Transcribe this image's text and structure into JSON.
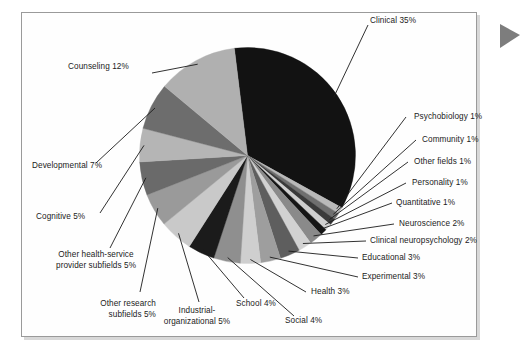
{
  "figure": {
    "type": "pie",
    "frame_border_color": "#9a9a9a",
    "background_color": "#ffffff",
    "marker_icon": "right-triangle-marker",
    "marker_color": "#7d7d7d"
  },
  "chart_data": {
    "type": "pie",
    "title": "",
    "xlabel": "",
    "ylabel": "",
    "units": "percent",
    "total": 100,
    "legend": "labels-with-leader-lines",
    "grid": false,
    "categories": [
      "Clinical",
      "Psychobiology",
      "Community",
      "Other fields",
      "Personality",
      "Quantitative",
      "Neuroscience",
      "Clinical neuropsychology",
      "Educational",
      "Experimental",
      "Health",
      "Social",
      "School",
      "Industrial-organizational",
      "Other research subfields",
      "Other health-service provider subfields",
      "Cognitive",
      "Developmental",
      "Counseling"
    ],
    "values": [
      35,
      1,
      1,
      1,
      1,
      1,
      2,
      2,
      3,
      3,
      3,
      4,
      4,
      5,
      5,
      5,
      5,
      7,
      12
    ],
    "colors": [
      "#121212",
      "#b9b9b9",
      "#6f6f6f",
      "#3a3a3a",
      "#cfcfcf",
      "#151515",
      "#8a8a8a",
      "#d2d2d2",
      "#5e5e5e",
      "#9e9e9e",
      "#cfcfcf",
      "#8f8f8f",
      "#1b1b1b",
      "#c9c9c9",
      "#9a9a9a",
      "#6a6a6a",
      "#b5b5b5",
      "#6d6d6d",
      "#b0b0b0"
    ],
    "slices": [
      {
        "label": "Clinical 35%",
        "name": "Clinical",
        "value": 35,
        "color": "#121212"
      },
      {
        "label": "Psychobiology 1%",
        "name": "Psychobiology",
        "value": 1,
        "color": "#b9b9b9"
      },
      {
        "label": "Community 1%",
        "name": "Community",
        "value": 1,
        "color": "#6f6f6f"
      },
      {
        "label": "Other fields 1%",
        "name": "Other fields",
        "value": 1,
        "color": "#3a3a3a"
      },
      {
        "label": "Personality 1%",
        "name": "Personality",
        "value": 1,
        "color": "#cfcfcf"
      },
      {
        "label": "Quantitative 1%",
        "name": "Quantitative",
        "value": 1,
        "color": "#151515"
      },
      {
        "label": "Neuroscience 2%",
        "name": "Neuroscience",
        "value": 2,
        "color": "#8a8a8a"
      },
      {
        "label": "Clinical neuropsychology 2%",
        "name": "Clinical neuropsychology",
        "value": 2,
        "color": "#d2d2d2"
      },
      {
        "label": "Educational 3%",
        "name": "Educational",
        "value": 3,
        "color": "#5e5e5e"
      },
      {
        "label": "Experimental 3%",
        "name": "Experimental",
        "value": 3,
        "color": "#9e9e9e"
      },
      {
        "label": "Health 3%",
        "name": "Health",
        "value": 3,
        "color": "#cfcfcf"
      },
      {
        "label": "Social 4%",
        "name": "Social",
        "value": 4,
        "color": "#8f8f8f"
      },
      {
        "label": "School 4%",
        "name": "School",
        "value": 4,
        "color": "#1b1b1b"
      },
      {
        "label": "Industrial-\norganizational 5%",
        "name": "Industrial-organizational",
        "value": 5,
        "color": "#c9c9c9"
      },
      {
        "label": "Other research\nsubfields 5%",
        "name": "Other research subfields",
        "value": 5,
        "color": "#9a9a9a"
      },
      {
        "label": "Other health-service\nprovider subfields 5%",
        "name": "Other health-service provider subfields",
        "value": 5,
        "color": "#6a6a6a"
      },
      {
        "label": "Cognitive 5%",
        "name": "Cognitive",
        "value": 5,
        "color": "#b5b5b5"
      },
      {
        "label": "Developmental 7%",
        "name": "Developmental",
        "value": 7,
        "color": "#6d6d6d"
      },
      {
        "label": "Counseling 12%",
        "name": "Counseling",
        "value": 12,
        "color": "#b0b0b0"
      }
    ]
  }
}
